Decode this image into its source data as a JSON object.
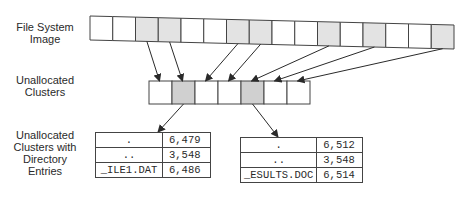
{
  "labels": {
    "fs_image": [
      "File System",
      "Image"
    ],
    "unalloc": [
      "Unallocated",
      "Clusters"
    ],
    "unalloc_dir": [
      "Unallocated",
      "Clusters with",
      "Directory",
      "Entries"
    ]
  },
  "fs_image_strip": {
    "cell_count": 16,
    "shaded_cells": [
      3,
      4,
      7,
      8,
      11,
      13,
      16
    ]
  },
  "unallocated_strip": {
    "cell_count": 7,
    "shaded_cells": [
      2,
      5
    ]
  },
  "colors": {
    "shaded_fill": "#e3e3e3",
    "shaded_fill_mid": "#d0d0d0",
    "line": "#444444"
  },
  "tables": [
    {
      "rows": [
        {
          "name": ".",
          "cluster": "6,479"
        },
        {
          "name": "..",
          "cluster": "3,548"
        },
        {
          "name": "_ILE1.DAT",
          "cluster": "6,486"
        }
      ]
    },
    {
      "rows": [
        {
          "name": ".",
          "cluster": "6,512"
        },
        {
          "name": "..",
          "cluster": "3,548"
        },
        {
          "name": "_ESULTS.DOC",
          "cluster": "6,514"
        }
      ]
    }
  ]
}
